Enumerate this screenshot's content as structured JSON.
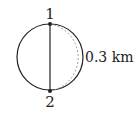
{
  "diagram": {
    "points": [
      {
        "label": "1",
        "position": "top"
      },
      {
        "label": "2",
        "position": "bottom"
      }
    ],
    "distance_label": "0.3 km",
    "colors": {
      "stroke": "#222222",
      "dashed": "#999999"
    }
  }
}
